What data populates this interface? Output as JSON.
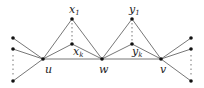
{
  "diagram": {
    "type": "graph",
    "colors": {
      "edge": "#777777",
      "node": "#111111",
      "label": "#222222"
    },
    "nodes": [
      {
        "id": "l1",
        "x": 13,
        "y": 38
      },
      {
        "id": "l2",
        "x": 13,
        "y": 49
      },
      {
        "id": "l3",
        "x": 13,
        "y": 81
      },
      {
        "id": "u",
        "x": 43,
        "y": 59,
        "label": "u"
      },
      {
        "id": "x1",
        "x": 72,
        "y": 19,
        "label": "x",
        "sub": "1"
      },
      {
        "id": "xk",
        "x": 72,
        "y": 44,
        "label": "x",
        "sub": "k"
      },
      {
        "id": "w",
        "x": 102,
        "y": 59,
        "label": "w"
      },
      {
        "id": "y1",
        "x": 132,
        "y": 19,
        "label": "y",
        "sub": "1"
      },
      {
        "id": "yk",
        "x": 132,
        "y": 44,
        "label": "y",
        "sub": "k"
      },
      {
        "id": "v",
        "x": 161,
        "y": 59,
        "label": "v"
      },
      {
        "id": "r1",
        "x": 191,
        "y": 38
      },
      {
        "id": "r2",
        "x": 191,
        "y": 49
      },
      {
        "id": "r3",
        "x": 191,
        "y": 81
      }
    ],
    "labels": {
      "u": "u",
      "w": "w",
      "v": "v",
      "x": "x",
      "y": "y",
      "one": "1",
      "k": "k"
    }
  }
}
